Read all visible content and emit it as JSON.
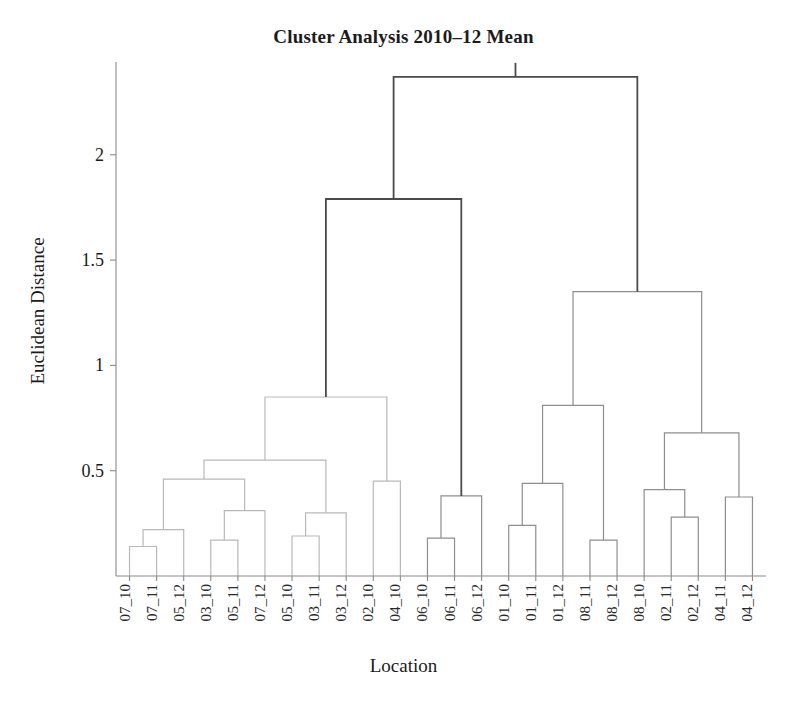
{
  "title": "Cluster Analysis 2010–12 Mean",
  "xlabel": "Location",
  "ylabel": "Euclidean Distance",
  "colors": {
    "axis": "#8a8a8a",
    "text": "#1b1b1b",
    "link_light": "#b9b9b9",
    "link_mid": "#8e8e8e",
    "link_dark": "#4a4a4a",
    "background": "#ffffff"
  },
  "chart_data": {
    "type": "dendrogram",
    "title": "Cluster Analysis 2010–12 Mean",
    "xlabel": "Location",
    "ylabel": "Euclidean Distance",
    "ylim": [
      0,
      2.45
    ],
    "yticks": [
      0.5,
      1,
      1.5,
      2
    ],
    "ytick_labels": [
      "0.5",
      "1",
      "1.5",
      "2"
    ],
    "grid": false,
    "legend": null,
    "leaves": [
      "07_10",
      "07_11",
      "05_12",
      "03_10",
      "05_11",
      "07_12",
      "05_10",
      "03_11",
      "03_12",
      "02_10",
      "04_10",
      "06_10",
      "06_11",
      "06_12",
      "01_10",
      "01_11",
      "01_12",
      "08_11",
      "08_12",
      "08_10",
      "02_11",
      "02_12",
      "04_11",
      "04_12"
    ],
    "merges": [
      {
        "id": "m1",
        "left": "07_10",
        "right": "07_11",
        "height": 0.14,
        "color": "#b9b9b9"
      },
      {
        "id": "m2",
        "left": "m1",
        "right": "05_12",
        "height": 0.22,
        "color": "#b9b9b9"
      },
      {
        "id": "m3",
        "left": "03_10",
        "right": "05_11",
        "height": 0.17,
        "color": "#b9b9b9"
      },
      {
        "id": "m4",
        "left": "m3",
        "right": "07_12",
        "height": 0.31,
        "color": "#b9b9b9"
      },
      {
        "id": "m5",
        "left": "m2",
        "right": "m4",
        "height": 0.46,
        "color": "#b9b9b9"
      },
      {
        "id": "m6",
        "left": "05_10",
        "right": "03_11",
        "height": 0.19,
        "color": "#b9b9b9"
      },
      {
        "id": "m7",
        "left": "m6",
        "right": "03_12",
        "height": 0.3,
        "color": "#b9b9b9"
      },
      {
        "id": "m8",
        "left": "m5",
        "right": "m7",
        "height": 0.55,
        "color": "#b9b9b9"
      },
      {
        "id": "m9",
        "left": "02_10",
        "right": "04_10",
        "height": 0.45,
        "color": "#b9b9b9"
      },
      {
        "id": "m10",
        "left": "m8",
        "right": "m9",
        "height": 0.85,
        "color": "#b9b9b9"
      },
      {
        "id": "m11",
        "left": "06_10",
        "right": "06_11",
        "height": 0.18,
        "color": "#8e8e8e"
      },
      {
        "id": "m12",
        "left": "m11",
        "right": "06_12",
        "height": 0.38,
        "color": "#8e8e8e"
      },
      {
        "id": "m13",
        "left": "m10",
        "right": "m12",
        "height": 1.79,
        "color": "#4a4a4a"
      },
      {
        "id": "m14",
        "left": "01_10",
        "right": "01_11",
        "height": 0.24,
        "color": "#8e8e8e"
      },
      {
        "id": "m15",
        "left": "m14",
        "right": "01_12",
        "height": 0.44,
        "color": "#8e8e8e"
      },
      {
        "id": "m16",
        "left": "08_11",
        "right": "08_12",
        "height": 0.17,
        "color": "#8e8e8e"
      },
      {
        "id": "m17",
        "left": "m15",
        "right": "m16",
        "height": 0.81,
        "color": "#8e8e8e"
      },
      {
        "id": "m18",
        "left": "02_11",
        "right": "02_12",
        "height": 0.28,
        "color": "#8e8e8e"
      },
      {
        "id": "m19",
        "left": "08_10",
        "right": "m18",
        "height": 0.41,
        "color": "#8e8e8e"
      },
      {
        "id": "m20",
        "left": "04_11",
        "right": "04_12",
        "height": 0.375,
        "color": "#8e8e8e"
      },
      {
        "id": "m21",
        "left": "m19",
        "right": "m20",
        "height": 0.68,
        "color": "#8e8e8e"
      },
      {
        "id": "m22",
        "left": "m17",
        "right": "m21",
        "height": 1.35,
        "color": "#8e8e8e"
      },
      {
        "id": "m23",
        "left": "m13",
        "right": "m22",
        "height": 2.37,
        "color": "#4a4a4a"
      }
    ],
    "root": "m23"
  },
  "geometry": {
    "plot_left": 116,
    "plot_right": 766,
    "plot_top": 60,
    "plot_bottom": 576,
    "axis_top": 62,
    "leaf_label_y": 584,
    "tick_len": 6
  }
}
